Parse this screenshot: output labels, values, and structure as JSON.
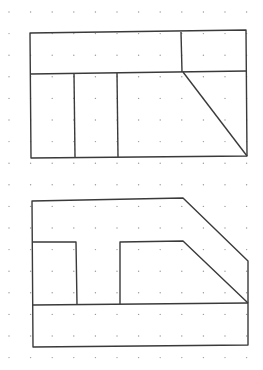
{
  "diagram": {
    "title": "",
    "colors": {
      "background": "#ffffff",
      "line": "#3a3a3a",
      "dot": "#9a9a9a"
    },
    "figures": [
      {
        "name": "top-figure",
        "parts": [
          "outer-rectangle",
          "upper-band",
          "upper-right-box",
          "left-column",
          "middle-column",
          "chamfer-diagonal"
        ]
      },
      {
        "name": "bottom-figure",
        "parts": [
          "outer-outline",
          "base-band",
          "left-notch",
          "right-stepped-notch"
        ]
      }
    ]
  }
}
